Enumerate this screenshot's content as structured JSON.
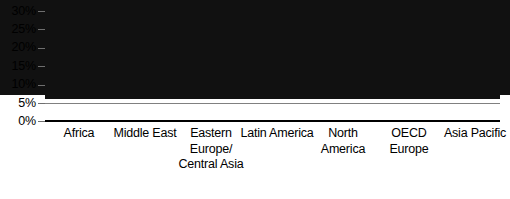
{
  "chart_data": {
    "type": "bar",
    "title": "",
    "xlabel": "",
    "ylabel": "",
    "categories": [
      "Africa",
      "Middle East",
      "Eastern Europe/ Central Asia",
      "Latin America",
      "North America",
      "OECD Europe",
      "Asia Pacific"
    ],
    "values": [
      26,
      24,
      21,
      11,
      9.5,
      5.3,
      4.6
    ],
    "ylim": [
      0,
      30
    ],
    "yticks": [
      0,
      5,
      10,
      15,
      20,
      25,
      30
    ],
    "ytick_labels": [
      "0%",
      "5%",
      "10%",
      "15%",
      "20%",
      "25%",
      "30%"
    ],
    "grid": true,
    "legend": "none",
    "bar_color": "#111111",
    "gridline_color": "#808080",
    "axis_color": "#000000"
  },
  "axis": {
    "y_labels": [
      "30%",
      "25%",
      "20%",
      "15%",
      "10%",
      "5%",
      "0%"
    ]
  }
}
